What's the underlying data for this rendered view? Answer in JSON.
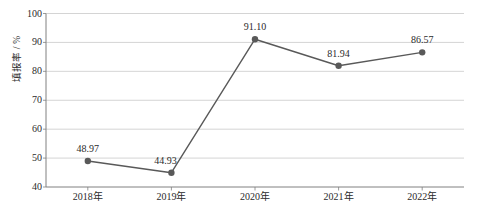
{
  "chart_data": {
    "type": "line",
    "title": "",
    "xlabel": "",
    "ylabel": "填报率 / %",
    "categories": [
      "2018年",
      "2019年",
      "2020年",
      "2021年",
      "2022年"
    ],
    "values": [
      48.97,
      44.93,
      91.1,
      81.94,
      86.57
    ],
    "point_labels": [
      "48.97",
      "44.93",
      "91.10",
      "81.94",
      "86.57"
    ],
    "ylim": [
      40,
      100
    ],
    "yticks": [
      40,
      50,
      60,
      70,
      80,
      90,
      100
    ],
    "ytick_labels": [
      "40",
      "50",
      "60",
      "70",
      "80",
      "90",
      "100"
    ],
    "grid": "horizontal",
    "legend": "none",
    "series_color": "#595959",
    "marker_color": "#595959",
    "gridline_color": "#c9c9c9",
    "axis_color": "#808080",
    "text_color": "#2b2b2b",
    "background_color": "#ffffff"
  }
}
